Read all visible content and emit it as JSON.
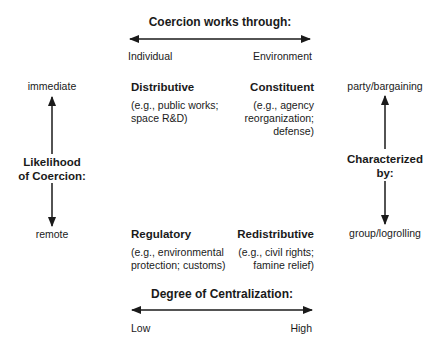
{
  "top_axis": {
    "title": "Coercion works through:",
    "left_label": "Individual",
    "right_label": "Environment"
  },
  "left_axis": {
    "title_line1": "Likelihood",
    "title_line2": "of Coercion:",
    "top_label": "immediate",
    "bottom_label": "remote"
  },
  "right_axis": {
    "title_line1": "Characterized",
    "title_line2": "by:",
    "top_label": "party/bargaining",
    "bottom_label": "group/logrolling"
  },
  "bottom_axis": {
    "title": "Degree of Centralization:",
    "left_label": "Low",
    "right_label": "High"
  },
  "quadrants": {
    "top_left": {
      "title": "Distributive",
      "example_line1": "(e.g., public works;",
      "example_line2": "space R&D)"
    },
    "top_right": {
      "title": "Constituent",
      "example_line1": "(e.g., agency",
      "example_line2": "reorganization;",
      "example_line3": "defense)"
    },
    "bottom_left": {
      "title": "Regulatory",
      "example_line1": "(e.g., environmental",
      "example_line2": "protection; customs)"
    },
    "bottom_right": {
      "title": "Redistributive",
      "example_line1": "(e.g., civil rights;",
      "example_line2": "famine relief)"
    }
  }
}
